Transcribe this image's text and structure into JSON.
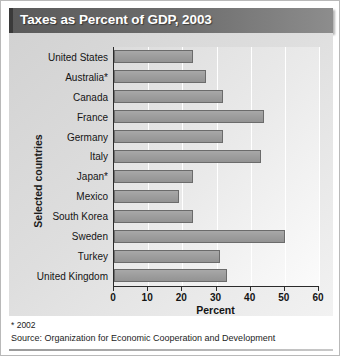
{
  "header": {
    "title": "Taxes as Percent of GDP, 2003"
  },
  "footnotes": {
    "asterisk_note": "* 2002",
    "source": "Source:  Organization for Economic Cooperation and Development"
  },
  "colors": {
    "title_bar_dark": "#5a5a5a",
    "title_bar_light": "#8d8d8d",
    "bar_fill": "#9d9d9d",
    "bar_border": "#6b6b6b",
    "panel_bg": "#dedede",
    "axis": "#2b2b2b",
    "gridline": "#ffffff"
  },
  "chart_data": {
    "type": "bar",
    "orientation": "horizontal",
    "title": "Taxes as Percent of GDP, 2003",
    "xlabel": "Percent",
    "ylabel": "Selected countries",
    "xlim": [
      0,
      60
    ],
    "xticks": [
      0,
      10,
      20,
      30,
      40,
      50,
      60
    ],
    "xtick_labels": [
      "0",
      "10",
      "20",
      "30",
      "40",
      "50",
      "60"
    ],
    "grid": "vertical",
    "legend": "none",
    "categories": [
      "United States",
      "Australia*",
      "Canada",
      "France",
      "Germany",
      "Italy",
      "Japan*",
      "Mexico",
      "South Korea",
      "Sweden",
      "Turkey",
      "United Kingdom"
    ],
    "values": [
      23,
      27,
      32,
      44,
      32,
      43,
      23,
      19,
      23,
      50,
      31,
      33
    ]
  }
}
